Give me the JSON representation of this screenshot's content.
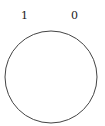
{
  "labels": {
    "left": "1",
    "right": "0"
  },
  "shape": {
    "type": "circle",
    "stroke": "#444444",
    "fill": "#ffffff"
  }
}
